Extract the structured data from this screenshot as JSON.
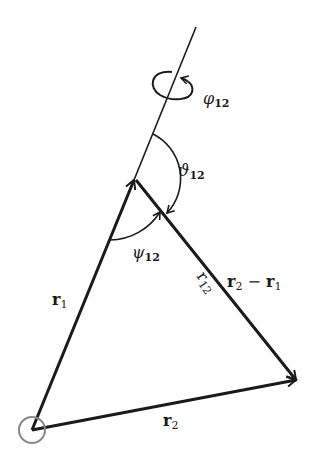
{
  "diagram": {
    "type": "vector-geometry",
    "colors": {
      "stroke": "#1a1a1a",
      "origin_circle": "#888888",
      "background": "#ffffff"
    },
    "vectors": {
      "r1": {
        "label": "r",
        "sub": "1"
      },
      "r2": {
        "label": "r",
        "sub": "2"
      },
      "r2_minus_r1": {
        "label_a": "r",
        "sub_a": "2",
        "minus": " − ",
        "label_b": "r",
        "sub_b": "1"
      }
    },
    "distance": {
      "label": "r",
      "sub": "12"
    },
    "angles": {
      "phi": {
        "symbol": "φ",
        "sub": "12"
      },
      "theta": {
        "symbol": "ϑ",
        "sub": "12"
      },
      "psi": {
        "symbol": "ψ",
        "sub": "12"
      }
    }
  }
}
